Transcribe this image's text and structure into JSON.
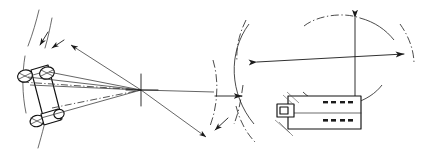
{
  "figure": {
    "background_color": "#ffffff",
    "line_color": "#1a1a1a",
    "width": 430,
    "height": 159,
    "panels": [
      {
        "id": "left",
        "name": "steering-geometry-panel",
        "description": "Plan view of a vehicle with steered front wheels and construction rays converging on the instantaneous turn centre",
        "elements": [
          {
            "name": "vehicle-chassis",
            "label": ""
          },
          {
            "name": "front-left-wheel",
            "label": ""
          },
          {
            "name": "front-right-wheel",
            "label": ""
          },
          {
            "name": "rear-axle-wheels",
            "label": ""
          },
          {
            "name": "steer-angle-arrow-outer",
            "label": ""
          },
          {
            "name": "steer-angle-arrow-inner",
            "label": ""
          },
          {
            "name": "turn-centre-crosshair",
            "label": ""
          },
          {
            "name": "turn-radius-rays",
            "label": ""
          },
          {
            "name": "turning-arc",
            "label": ""
          },
          {
            "name": "rear-axle-centreline",
            "label": ""
          }
        ]
      },
      {
        "id": "right",
        "name": "turning-circle-panel",
        "description": "Plan view of a vehicle inside its swept turning circle with diameter dimension arrows",
        "elements": [
          {
            "name": "vehicle-body",
            "label": ""
          },
          {
            "name": "front-bumper-block",
            "label": ""
          },
          {
            "name": "turning-circle-arc-left",
            "label": ""
          },
          {
            "name": "turning-circle-arc-right",
            "label": ""
          },
          {
            "name": "turning-circle-arc-top",
            "label": ""
          },
          {
            "name": "inner-clearance-arc",
            "label": ""
          },
          {
            "name": "turning-diameter-dimension-arrow",
            "label": ""
          },
          {
            "name": "vertical-centreline-arrow",
            "label": ""
          },
          {
            "name": "side-clearance-arrow",
            "label": ""
          }
        ]
      }
    ],
    "annotations": {
      "labels": [],
      "notes": []
    }
  }
}
